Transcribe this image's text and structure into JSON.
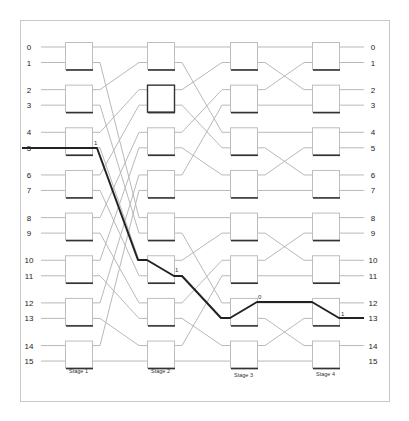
{
  "diagram": {
    "type": "multistage-interconnection-network",
    "colors": {
      "wire": "#b9b9b9",
      "highlight_path": "#222222",
      "frame": "#c8c8c8"
    },
    "inputs": [
      "0",
      "1",
      "2",
      "3",
      "4",
      "5",
      "6",
      "7",
      "8",
      "9",
      "10",
      "11",
      "12",
      "13",
      "14",
      "15"
    ],
    "outputs": [
      "0",
      "1",
      "2",
      "3",
      "4",
      "5",
      "6",
      "7",
      "8",
      "9",
      "10",
      "11",
      "12",
      "13",
      "14",
      "15"
    ],
    "stages": [
      {
        "label": "Stage 1",
        "switch_count": 8
      },
      {
        "label": "Stage 2",
        "switch_count": 8
      },
      {
        "label": "Stage 3",
        "switch_count": 8
      },
      {
        "label": "Stage 4",
        "switch_count": 8
      }
    ],
    "highlighted_switch": {
      "stage": 1,
      "switch": 1
    },
    "routing_path": {
      "source": "5",
      "destination": "13",
      "switch_settings": [
        {
          "stage": "Stage 1",
          "switch": 2,
          "label": "1"
        },
        {
          "stage": "Stage 2",
          "switch": 5,
          "label": "1"
        },
        {
          "stage": "Stage 3",
          "switch": 6,
          "label": "0"
        },
        {
          "stage": "Stage 4",
          "switch": 6,
          "label": "1"
        }
      ]
    }
  }
}
